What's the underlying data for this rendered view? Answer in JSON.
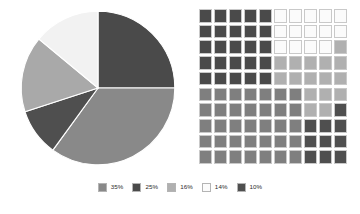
{
  "chart_data": [
    {
      "type": "pie",
      "title": "",
      "xlabel": "",
      "ylabel": "",
      "categories": [
        "35%",
        "25%",
        "16%",
        "14%",
        "10%"
      ],
      "values": [
        35,
        25,
        16,
        14,
        10
      ],
      "labels_shown_on_slices": false,
      "start_angle_deg": 0,
      "direction": "clockwise",
      "slices": [
        {
          "label": "25%",
          "value": 25,
          "color": "#4a4a4a",
          "start_deg": 0,
          "end_deg": 90
        },
        {
          "label": "35%",
          "value": 35,
          "color": "#898989",
          "start_deg": 90,
          "end_deg": 216
        },
        {
          "label": "10%",
          "value": 10,
          "color": "#4f4f4f",
          "start_deg": 216,
          "end_deg": 252
        },
        {
          "label": "16%",
          "value": 16,
          "color": "#a9a9a9",
          "start_deg": 252,
          "end_deg": 309.6
        },
        {
          "label": "14%",
          "value": 14,
          "color": "#f2f2f2",
          "start_deg": 309.6,
          "end_deg": 360
        }
      ],
      "legend_position": "bottom"
    },
    {
      "type": "waffle",
      "title": "",
      "rows": 10,
      "columns": 10,
      "unit": "1 square = 1%",
      "categories": [
        "25%",
        "14%",
        "16%",
        "35%",
        "10%"
      ],
      "values": [
        25,
        14,
        16,
        35,
        10
      ],
      "colors": [
        "#4a4a4a",
        "#fbfbfb",
        "#b0b0b0",
        "#7f7f7f",
        "#4f4f4f"
      ],
      "cells": [
        [
          "#4a4a4a",
          "#4a4a4a",
          "#4a4a4a",
          "#4a4a4a",
          "#4a4a4a",
          "#fbfbfb",
          "#fbfbfb",
          "#fbfbfb",
          "#fbfbfb",
          "#fbfbfb"
        ],
        [
          "#4a4a4a",
          "#4a4a4a",
          "#4a4a4a",
          "#4a4a4a",
          "#4a4a4a",
          "#fbfbfb",
          "#fbfbfb",
          "#fbfbfb",
          "#fbfbfb",
          "#fbfbfb"
        ],
        [
          "#4a4a4a",
          "#4a4a4a",
          "#4a4a4a",
          "#4a4a4a",
          "#4a4a4a",
          "#fbfbfb",
          "#fbfbfb",
          "#fbfbfb",
          "#fbfbfb",
          "#b0b0b0"
        ],
        [
          "#4a4a4a",
          "#4a4a4a",
          "#4a4a4a",
          "#4a4a4a",
          "#4a4a4a",
          "#b0b0b0",
          "#b0b0b0",
          "#b0b0b0",
          "#b0b0b0",
          "#b0b0b0"
        ],
        [
          "#4a4a4a",
          "#4a4a4a",
          "#4a4a4a",
          "#4a4a4a",
          "#4a4a4a",
          "#b0b0b0",
          "#b0b0b0",
          "#b0b0b0",
          "#b0b0b0",
          "#b0b0b0"
        ],
        [
          "#7f7f7f",
          "#7f7f7f",
          "#7f7f7f",
          "#7f7f7f",
          "#7f7f7f",
          "#7f7f7f",
          "#7f7f7f",
          "#b0b0b0",
          "#b0b0b0",
          "#b0b0b0"
        ],
        [
          "#7f7f7f",
          "#7f7f7f",
          "#7f7f7f",
          "#7f7f7f",
          "#7f7f7f",
          "#7f7f7f",
          "#7f7f7f",
          "#b0b0b0",
          "#b0b0b0",
          "#4f4f4f"
        ],
        [
          "#7f7f7f",
          "#7f7f7f",
          "#7f7f7f",
          "#7f7f7f",
          "#7f7f7f",
          "#7f7f7f",
          "#7f7f7f",
          "#4f4f4f",
          "#4f4f4f",
          "#4f4f4f"
        ],
        [
          "#7f7f7f",
          "#7f7f7f",
          "#7f7f7f",
          "#7f7f7f",
          "#7f7f7f",
          "#7f7f7f",
          "#7f7f7f",
          "#4f4f4f",
          "#4f4f4f",
          "#4f4f4f"
        ],
        [
          "#7f7f7f",
          "#7f7f7f",
          "#7f7f7f",
          "#7f7f7f",
          "#7f7f7f",
          "#7f7f7f",
          "#7f7f7f",
          "#4f4f4f",
          "#4f4f4f",
          "#4f4f4f"
        ]
      ]
    }
  ],
  "legend": {
    "items": [
      {
        "label": "35%",
        "color": "#898989"
      },
      {
        "label": "25%",
        "color": "#4a4a4a"
      },
      {
        "label": "16%",
        "color": "#b0b0b0"
      },
      {
        "label": "14%",
        "color": "#fbfbfb"
      },
      {
        "label": "10%",
        "color": "#4f4f4f"
      }
    ]
  }
}
